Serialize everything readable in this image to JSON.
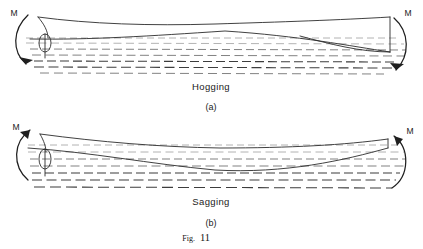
{
  "figure": {
    "number_label": "Fig.",
    "number": "11",
    "full_caption": "Fig. 11"
  },
  "panels": [
    {
      "id": "hogging",
      "title": "Hogging",
      "sublabel": "(a)",
      "moment_left_label": "M",
      "moment_right_label": "M",
      "moment_left_direction": "clockwise-downward",
      "moment_right_direction": "clockwise-downward",
      "description": "Hull deck arches upward and keel rises amidships",
      "waterline_count": 7
    },
    {
      "id": "sagging",
      "title": "Sagging",
      "sublabel": "(b)",
      "moment_left_label": "M",
      "moment_right_label": "M",
      "moment_left_direction": "counter-clockwise-upward",
      "moment_right_direction": "counter-clockwise-upward",
      "description": "Hull deck dips downward and keel sags amidships",
      "waterline_count": 7
    }
  ],
  "colors": {
    "background": "#ffffff",
    "hull_stroke": "#2b2b2b",
    "water_stroke": "#6b6b6b",
    "water_stroke_faint": "#9a9a9a",
    "water_stroke_heavy": "#3d3d3d",
    "text": "#1a1a1a"
  }
}
